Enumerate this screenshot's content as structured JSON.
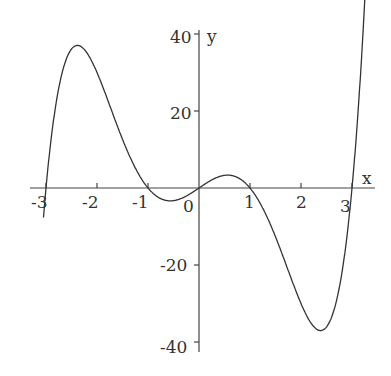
{
  "chart_data": {
    "type": "line",
    "title": "",
    "xlabel": "x",
    "ylabel": "y",
    "function": "y = x(x^2-1)(x^2-9)",
    "xlim": [
      -3.1,
      3.3
    ],
    "ylim": [
      -40,
      40
    ],
    "x_ticks": [
      "-3",
      "-2",
      "-1",
      "0",
      "1",
      "2",
      "3"
    ],
    "y_ticks": [
      "40",
      "20",
      "-20",
      "-40"
    ],
    "x": [
      -3.05,
      -3,
      -2.5,
      -2.3,
      -2,
      -1.5,
      -1,
      -0.5,
      0,
      0.5,
      1,
      1.5,
      2,
      2.3,
      2.5,
      3,
      3.25
    ],
    "values": [
      -9.4,
      0,
      31.0,
      36.6,
      30,
      14.2,
      0,
      -3.3,
      0,
      3.3,
      0,
      -14.2,
      -30,
      -36.6,
      -31.0,
      0,
      38
    ],
    "grid": false,
    "legend": null
  },
  "labels": {
    "x": "x",
    "y": "y",
    "xt": [
      "-3",
      "-2",
      "-1",
      "0",
      "1",
      "2",
      "3"
    ],
    "yt": [
      "40",
      "20",
      "-20",
      "-40"
    ]
  }
}
